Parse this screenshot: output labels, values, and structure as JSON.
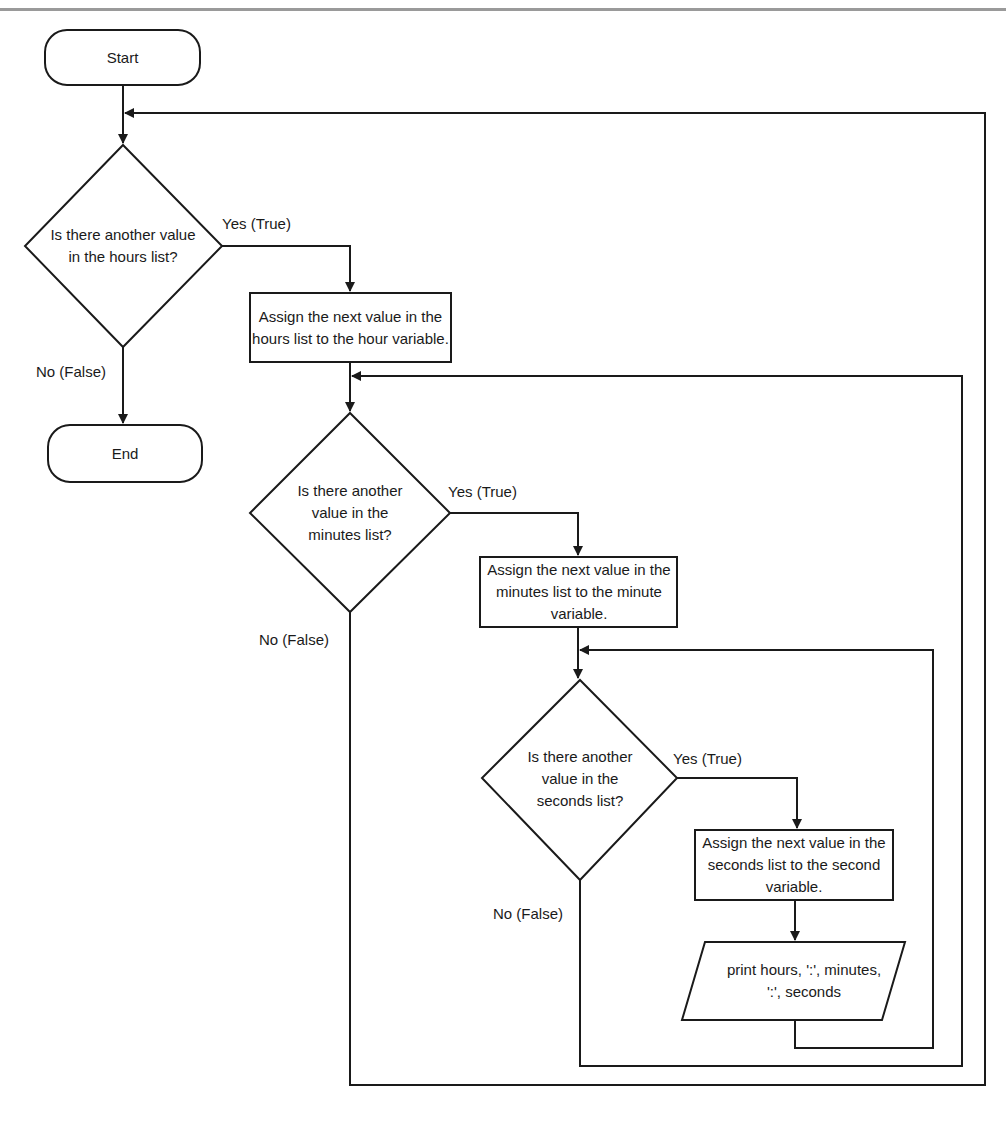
{
  "diagram": {
    "type": "flowchart",
    "colors": {
      "stroke": "#1a1a1a",
      "background": "#ffffff",
      "topbar": "#9a9a9a"
    },
    "nodes": {
      "start": {
        "shape": "terminal",
        "label": "Start"
      },
      "end": {
        "shape": "terminal",
        "label": "End"
      },
      "hours_decision": {
        "shape": "decision",
        "label": "Is there another value in the hours list?"
      },
      "hours_assign": {
        "shape": "process",
        "label": "Assign the next value in the hours list to the hour variable."
      },
      "minutes_decision": {
        "shape": "decision",
        "label": "Is there another value in the minutes list?"
      },
      "minutes_assign": {
        "shape": "process",
        "label": "Assign the next value in the minutes list to the minute variable."
      },
      "seconds_decision": {
        "shape": "decision",
        "label": "Is there another value in the seconds list?"
      },
      "seconds_assign": {
        "shape": "process",
        "label": "Assign the next value in the seconds list to the second variable."
      },
      "print": {
        "shape": "io",
        "label": "print hours, ':', minutes, ':', seconds"
      }
    },
    "edge_labels": {
      "hours_yes": "Yes (True)",
      "hours_no": "No (False)",
      "minutes_yes": "Yes (True)",
      "minutes_no": "No (False)",
      "seconds_yes": "Yes (True)",
      "seconds_no": "No (False)"
    },
    "edges": [
      {
        "from": "start",
        "to": "hours_decision"
      },
      {
        "from": "hours_decision",
        "to": "hours_assign",
        "label": "Yes (True)"
      },
      {
        "from": "hours_decision",
        "to": "end",
        "label": "No (False)"
      },
      {
        "from": "hours_assign",
        "to": "minutes_decision"
      },
      {
        "from": "minutes_decision",
        "to": "minutes_assign",
        "label": "Yes (True)"
      },
      {
        "from": "minutes_decision",
        "to": "hours_decision",
        "label": "No (False)"
      },
      {
        "from": "minutes_assign",
        "to": "seconds_decision"
      },
      {
        "from": "seconds_decision",
        "to": "seconds_assign",
        "label": "Yes (True)"
      },
      {
        "from": "seconds_decision",
        "to": "minutes_decision",
        "label": "No (False)"
      },
      {
        "from": "seconds_assign",
        "to": "print"
      },
      {
        "from": "print",
        "to": "seconds_decision"
      }
    ]
  }
}
